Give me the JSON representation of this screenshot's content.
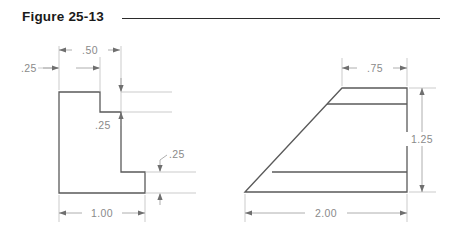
{
  "figure": {
    "title": "Figure 25-13"
  },
  "colors": {
    "outline": "#5a5a5a",
    "dimension_line": "#9a9a9a",
    "dimension_text": "#8a8a8a",
    "title_text": "#1a1a1a",
    "title_rule": "#2b2b2b",
    "background": "#ffffff"
  },
  "left_view": {
    "name": "c-channel-profile",
    "dimensions": {
      "left_thickness": ".25",
      "top_notch_width": ".50",
      "upper_flange_thickness": ".25",
      "lower_flange_thickness": ".25",
      "overall_width": "1.00"
    }
  },
  "right_view": {
    "name": "wedge-profile",
    "dimensions": {
      "top_width": ".75",
      "overall_height": "1.25",
      "overall_width": "2.00"
    }
  }
}
